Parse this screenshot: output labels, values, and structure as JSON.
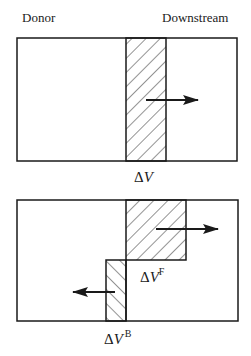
{
  "diagram": {
    "labels": {
      "donor": "Donor",
      "downstream": "Downstream"
    },
    "top_panel": {
      "delta_symbol": "Δ",
      "volume_symbol": "V",
      "caption": "ΔV",
      "arrow_direction": "right"
    },
    "bottom_panel": {
      "forward": {
        "delta_symbol": "Δ",
        "volume_symbol": "V",
        "superscript": "F",
        "caption": "ΔV^F",
        "arrow_direction": "right"
      },
      "backward": {
        "delta_symbol": "Δ",
        "volume_symbol": "V",
        "superscript": "B",
        "caption": "ΔV^B",
        "arrow_direction": "left"
      }
    },
    "colors": {
      "stroke": "#1a1a1a",
      "background": "#ffffff",
      "hatch": "#2a2a2a"
    }
  }
}
